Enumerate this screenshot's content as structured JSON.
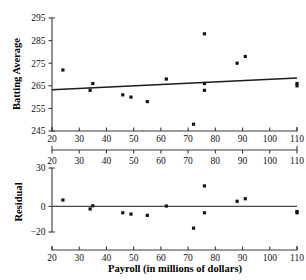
{
  "figure": {
    "caption": "",
    "point_color": "#141414",
    "line_color": "#1c1c1c",
    "axis_color": "#3a3a3a"
  },
  "chart_data": [
    {
      "type": "scatter",
      "panel": "top",
      "title": "",
      "xlabel": "",
      "ylabel": "Batting Average",
      "xlim": [
        20,
        110
      ],
      "ylim": [
        245,
        295
      ],
      "xticks": [
        20,
        30,
        40,
        50,
        60,
        70,
        80,
        90,
        100,
        110
      ],
      "yticks": [
        245,
        255,
        265,
        275,
        285,
        295
      ],
      "xticklabels": [
        "20",
        "30",
        "40",
        "50",
        "60",
        "70",
        "80",
        "90",
        "100",
        "110"
      ],
      "yticklabels": [
        "245",
        "255",
        "265",
        "275",
        "285",
        "295"
      ],
      "grid": false,
      "legend": null,
      "x": [
        24,
        34,
        35,
        46,
        49,
        55,
        62,
        72,
        76,
        76,
        76,
        88,
        91,
        110,
        110
      ],
      "y": [
        272,
        263,
        266,
        261,
        260,
        258,
        268,
        248,
        288,
        266,
        263,
        275,
        278,
        266,
        265
      ],
      "fit_line": {
        "name": "least-squares regression line",
        "x": [
          20,
          110
        ],
        "y": [
          263.2,
          268.5
        ]
      }
    },
    {
      "type": "scatter",
      "panel": "bottom",
      "title": "",
      "xlabel": "Payroll (in millions of dollars)",
      "ylabel": "Residual",
      "xlim": [
        20,
        110
      ],
      "ylim": [
        -20,
        30
      ],
      "xticks": [
        20,
        30,
        40,
        50,
        60,
        70,
        80,
        90,
        100,
        110
      ],
      "yticks": [
        -20,
        0,
        30
      ],
      "xticklabels": [
        "20",
        "30",
        "40",
        "50",
        "60",
        "70",
        "80",
        "90",
        "100",
        "110"
      ],
      "yticklabels": [
        "-20",
        "0",
        "30"
      ],
      "grid": false,
      "legend": null,
      "x": [
        24,
        34,
        35,
        46,
        49,
        55,
        62,
        72,
        76,
        76,
        88,
        91,
        110,
        110
      ],
      "y": [
        5,
        -2,
        0.5,
        -5,
        -6,
        -7,
        0.3,
        -17,
        16,
        -5,
        4,
        6,
        -4,
        -5
      ],
      "zero_line": {
        "name": "residual zero reference line",
        "x": [
          20,
          110
        ],
        "y": [
          0,
          0
        ]
      }
    }
  ],
  "top_panel": {
    "y_axis_title": "Batting Average",
    "y_tick_labels": [
      "295",
      "285",
      "275",
      "265",
      "255",
      "245"
    ],
    "x_tick_labels": [
      "20",
      "30",
      "40",
      "50",
      "60",
      "70",
      "80",
      "90",
      "100",
      "110"
    ]
  },
  "bottom_panel": {
    "y_axis_title": "Residual",
    "x_axis_title": "Payroll (in millions of dollars)",
    "y_tick_labels": [
      "30",
      "0",
      "-20"
    ],
    "x_tick_labels": [
      "20",
      "30",
      "40",
      "50",
      "60",
      "70",
      "80",
      "90",
      "100",
      "110"
    ]
  }
}
